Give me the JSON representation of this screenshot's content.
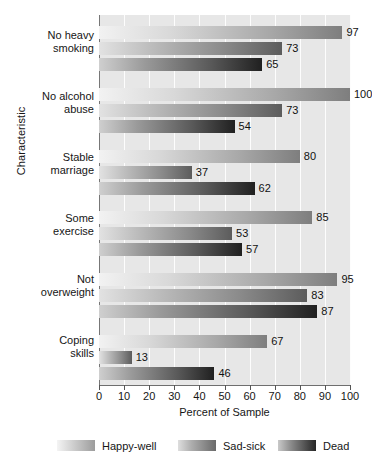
{
  "chart_data": {
    "type": "bar",
    "orientation": "horizontal",
    "title": "",
    "xlabel": "Percent of Sample",
    "ylabel": "Characteristic",
    "xlim": [
      0,
      100
    ],
    "xticks": [
      0,
      10,
      20,
      30,
      40,
      50,
      60,
      70,
      80,
      90,
      100
    ],
    "grid": true,
    "legend_position": "bottom",
    "categories": [
      "No heavy smoking",
      "No alcohol abuse",
      "Stable marriage",
      "Some exercise",
      "Not overweight",
      "Coping skills"
    ],
    "series": [
      {
        "name": "Happy-well",
        "values": [
          97,
          100,
          80,
          85,
          95,
          67
        ]
      },
      {
        "name": "Sad-sick",
        "values": [
          73,
          73,
          37,
          53,
          83,
          13
        ]
      },
      {
        "name": "Dead",
        "values": [
          65,
          54,
          62,
          57,
          87,
          46
        ]
      }
    ]
  },
  "axes": {
    "y_title": "Characteristic",
    "x_title": "Percent of Sample",
    "x_tick_labels": [
      "0",
      "10",
      "20",
      "30",
      "40",
      "50",
      "60",
      "70",
      "80",
      "90",
      "100"
    ],
    "category_labels": [
      [
        "No heavy",
        "smoking"
      ],
      [
        "No alcohol",
        "abuse"
      ],
      [
        "Stable",
        "marriage"
      ],
      [
        "Some",
        "exercise"
      ],
      [
        "Not",
        "overweight"
      ],
      [
        "Coping",
        "skills"
      ]
    ]
  },
  "legend": {
    "items": [
      {
        "label": "Happy-well",
        "swatch": "gradient-light"
      },
      {
        "label": "Sad-sick",
        "swatch": "gradient-medium"
      },
      {
        "label": "Dead",
        "swatch": "gradient-dark"
      }
    ]
  },
  "colors": {
    "plot_background": "#e7e7e7",
    "gridline": "#fdfdfd",
    "axis": "#6e6e6e",
    "text": "#161616",
    "series_happy_well": "#9c9c9c",
    "series_sad_sick": "#6a6a6a",
    "series_dead": "#262626"
  },
  "value_labels": {
    "g0": [
      "97",
      "73",
      "65"
    ],
    "g1": [
      "100",
      "73",
      "54"
    ],
    "g2": [
      "80",
      "37",
      "62"
    ],
    "g3": [
      "85",
      "53",
      "57"
    ],
    "g4": [
      "95",
      "83",
      "87"
    ],
    "g5": [
      "67",
      "13",
      "46"
    ]
  }
}
